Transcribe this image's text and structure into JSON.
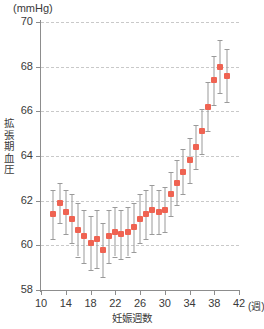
{
  "chart_data": {
    "type": "scatter",
    "title": "",
    "unit_label": "(mmHg)",
    "xlabel": "妊娠週数",
    "ylabel": "拡張期血圧",
    "x_unit": "(週)",
    "xlim": [
      10,
      42
    ],
    "ylim": [
      58,
      70
    ],
    "xticks": [
      10,
      14,
      18,
      22,
      26,
      30,
      34,
      38,
      42
    ],
    "yticks": [
      58,
      60,
      62,
      64,
      66,
      68,
      70
    ],
    "grid": "horizontal-dashed",
    "legend": "none",
    "marker_color": "#ef6352",
    "errorbar_color": "#9a9a9a",
    "x": [
      12,
      13,
      14,
      15,
      16,
      17,
      18,
      19,
      20,
      21,
      22,
      23,
      24,
      25,
      26,
      27,
      28,
      29,
      30,
      31,
      32,
      33,
      34,
      35,
      36,
      37,
      38,
      39,
      40
    ],
    "values": [
      61.4,
      61.9,
      61.5,
      61.2,
      60.7,
      60.4,
      60.1,
      60.3,
      59.8,
      60.4,
      60.6,
      60.5,
      60.6,
      60.8,
      61.2,
      61.4,
      61.6,
      61.5,
      61.6,
      62.3,
      62.8,
      63.3,
      63.8,
      64.4,
      65.1,
      66.2,
      67.4,
      68.0,
      67.6
    ],
    "err_low": [
      60.3,
      61.0,
      60.5,
      60.1,
      59.5,
      59.2,
      58.9,
      59.0,
      58.6,
      59.2,
      59.5,
      59.4,
      59.5,
      59.7,
      60.1,
      60.3,
      60.5,
      60.5,
      60.6,
      61.3,
      61.8,
      62.3,
      62.8,
      63.4,
      64.1,
      65.1,
      66.3,
      66.8,
      66.4
    ],
    "err_high": [
      62.5,
      62.8,
      62.5,
      62.3,
      61.9,
      61.6,
      61.3,
      61.6,
      61.0,
      61.6,
      61.7,
      61.6,
      61.7,
      61.9,
      62.3,
      62.5,
      62.7,
      62.5,
      62.6,
      63.3,
      63.8,
      64.3,
      64.8,
      65.4,
      66.1,
      67.3,
      68.5,
      69.2,
      68.8
    ]
  }
}
